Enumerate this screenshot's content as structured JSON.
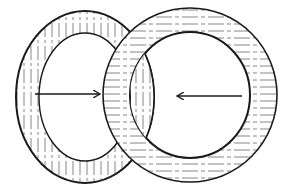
{
  "diagram": {
    "title": "",
    "background": "#ffffff",
    "stroke_color": "#1a1a1a",
    "hatch_color": "#555555",
    "rings": [
      {
        "id": "left-ring",
        "center": [
          85,
          97
        ],
        "outer_radius_x": 69,
        "outer_radius_y": 86,
        "inner_radius_x": 46,
        "inner_radius_y": 64,
        "hatch": "vertical"
      },
      {
        "id": "right-ring",
        "center": [
          190,
          95
        ],
        "outer_radius_x": 87,
        "outer_radius_y": 87,
        "inner_radius_x": 60,
        "inner_radius_y": 63,
        "hatch": "horizontal"
      }
    ],
    "arrows": [
      {
        "id": "arrow-right",
        "from": [
          35,
          94
        ],
        "to": [
          100,
          94
        ]
      },
      {
        "id": "arrow-left",
        "from": [
          242,
          96
        ],
        "to": [
          177,
          96
        ]
      }
    ]
  }
}
